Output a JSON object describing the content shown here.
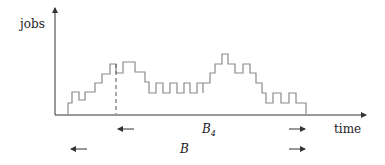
{
  "diagram": {
    "type": "step-function-plot",
    "y_axis_label": "jobs",
    "x_axis_label": "time",
    "interval_labels": {
      "inner": {
        "symbol": "B",
        "subscript": "4"
      },
      "outer": {
        "symbol": "B",
        "subscript": ""
      }
    },
    "colors": {
      "axes": "#333333",
      "curve": "#8a8a8a",
      "dashed_marker": "#555555",
      "text": "#222222"
    },
    "step_curve_points": [
      [
        68,
        114
      ],
      [
        68,
        103
      ],
      [
        72,
        103
      ],
      [
        72,
        92
      ],
      [
        79,
        92
      ],
      [
        79,
        100
      ],
      [
        85,
        100
      ],
      [
        85,
        92
      ],
      [
        95,
        92
      ],
      [
        95,
        83
      ],
      [
        102,
        83
      ],
      [
        102,
        74
      ],
      [
        110,
        74
      ],
      [
        110,
        64
      ],
      [
        116,
        64
      ],
      [
        116,
        73
      ],
      [
        123,
        73
      ],
      [
        123,
        62
      ],
      [
        135,
        62
      ],
      [
        135,
        72
      ],
      [
        145,
        72
      ],
      [
        145,
        82
      ],
      [
        149,
        82
      ],
      [
        149,
        93
      ],
      [
        156,
        93
      ],
      [
        156,
        83
      ],
      [
        163,
        83
      ],
      [
        163,
        93
      ],
      [
        170,
        93
      ],
      [
        170,
        83
      ],
      [
        177,
        83
      ],
      [
        177,
        93
      ],
      [
        184,
        93
      ],
      [
        184,
        83
      ],
      [
        190,
        83
      ],
      [
        190,
        93
      ],
      [
        197,
        93
      ],
      [
        197,
        83
      ],
      [
        203,
        83
      ],
      [
        203,
        93
      ],
      [
        203,
        83
      ],
      [
        210,
        83
      ],
      [
        210,
        73
      ],
      [
        215,
        73
      ],
      [
        215,
        64
      ],
      [
        222,
        64
      ],
      [
        222,
        54
      ],
      [
        228,
        54
      ],
      [
        228,
        64
      ],
      [
        235,
        64
      ],
      [
        235,
        73
      ],
      [
        243,
        73
      ],
      [
        243,
        64
      ],
      [
        250,
        64
      ],
      [
        250,
        73
      ],
      [
        256,
        73
      ],
      [
        256,
        83
      ],
      [
        262,
        83
      ],
      [
        262,
        93
      ],
      [
        266,
        93
      ],
      [
        266,
        103
      ],
      [
        273,
        103
      ],
      [
        273,
        93
      ],
      [
        281,
        93
      ],
      [
        281,
        103
      ],
      [
        289,
        103
      ],
      [
        289,
        93
      ],
      [
        296,
        93
      ],
      [
        296,
        103
      ],
      [
        306,
        103
      ],
      [
        306,
        114
      ]
    ],
    "dashed_marker_x": 116
  }
}
